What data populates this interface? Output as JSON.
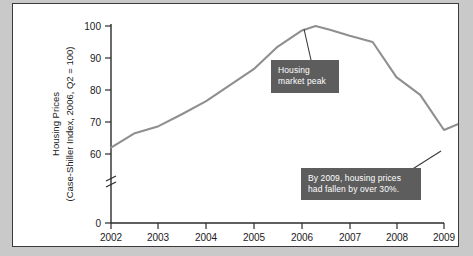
{
  "figure": {
    "background_color": "#c9c9c9",
    "panel_color": "#ffffff",
    "border_color": "#3a3a3a"
  },
  "chart_data": {
    "type": "line",
    "title": "",
    "xlabel": "",
    "ylabel": "Housing Prices",
    "ylabel_line2": "(Case-Shiller Index, 2006, Q2 = 100)",
    "x_tick_labels": [
      "2002",
      "2003",
      "2004",
      "2005",
      "2006",
      "2007",
      "2008",
      "2009"
    ],
    "y_tick_labels": [
      "0",
      "60",
      "70",
      "80",
      "90",
      "100"
    ],
    "ylim": [
      58,
      101
    ],
    "y_axis_break": true,
    "y_axis_break_label": "//",
    "grid": false,
    "legend": null,
    "line_color": "#8f8f8f",
    "x": [
      2002.0,
      2002.5,
      2003.0,
      2003.5,
      2004.0,
      2004.5,
      2005.0,
      2005.5,
      2006.0,
      2006.3,
      2006.6,
      2007.0,
      2007.5,
      2008.0,
      2008.5,
      2009.0,
      2009.4
    ],
    "values": [
      62.0,
      66.5,
      68.7,
      72.5,
      76.5,
      81.5,
      86.5,
      93.5,
      98.5,
      100.0,
      98.8,
      97.0,
      95.0,
      84.0,
      78.5,
      67.5,
      70.0
    ],
    "annotations": [
      {
        "name": "housing-market-peak",
        "line1": "Housing",
        "line2": "market peak",
        "box_color": "#5d5d5d",
        "text_color": "#ffffff",
        "points_to_x": 2006.3,
        "points_to_y": 100.0
      },
      {
        "name": "price-fall-2009",
        "line1": "By 2009, housing prices",
        "line2": "had fallen by over 30%.",
        "box_color": "#5d5d5d",
        "text_color": "#ffffff",
        "points_to_x": 2009.0,
        "points_to_y": 67.5
      }
    ]
  }
}
